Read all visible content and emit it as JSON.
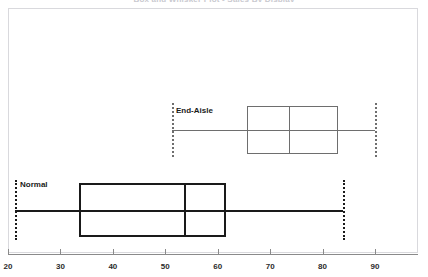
{
  "chart_data": {
    "type": "box",
    "title": "Box and Whisker Plot - Sales By Display",
    "xlabel": "",
    "ylabel": "",
    "xlim": [
      20,
      90
    ],
    "xticks": [
      20,
      30,
      40,
      50,
      60,
      70,
      80,
      90
    ],
    "xtick_labels": [
      "20",
      "30",
      "40",
      "50",
      "60",
      "70",
      "80",
      "90"
    ],
    "grid": false,
    "legend": "none",
    "orientation": "horizontal",
    "categories": [
      "End-Aisle",
      "Normal"
    ],
    "boxes": [
      {
        "label": "End-Aisle",
        "whisker_low": 51.3,
        "q1": 65.6,
        "median": 73.6,
        "q3": 82.9,
        "whisker_high": 90.0,
        "color": "#6e6e6e",
        "line_width": 1
      },
      {
        "label": "Normal",
        "whisker_low": 21.3,
        "q1": 33.5,
        "median": 53.6,
        "q3": 61.6,
        "whisker_high": 83.9,
        "color": "#1a1a1a",
        "line_width": 2
      }
    ]
  },
  "colors": {
    "frame": "#d9d9dd",
    "axis": "#8a8a8a",
    "tick_label": "#2b2b2b",
    "title": "#c9c9cf",
    "background": "#ffffff"
  }
}
